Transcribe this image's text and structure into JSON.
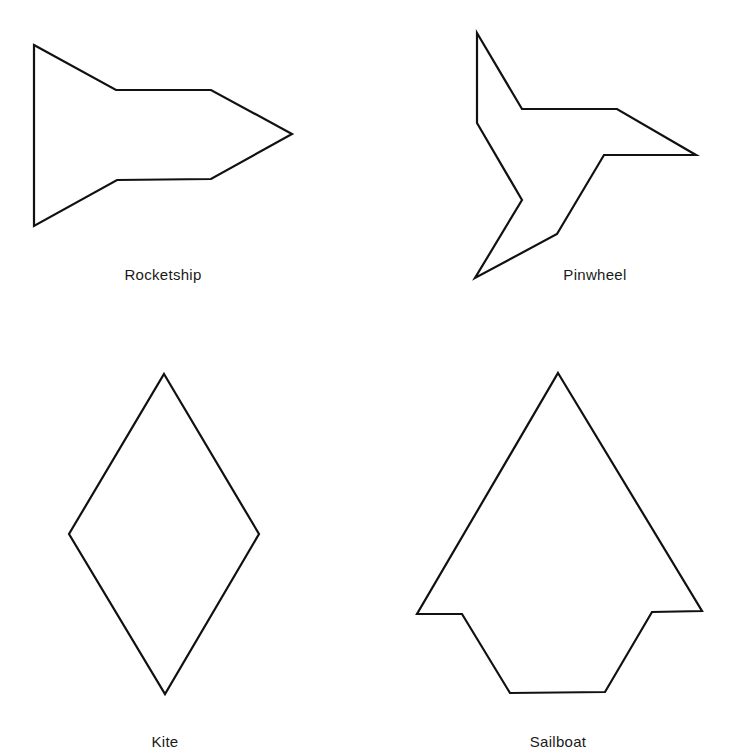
{
  "figure": {
    "stroke_color": "#111111",
    "background_color": "#ffffff",
    "shapes": [
      {
        "id": "rocketship",
        "label": "Rocketship",
        "label_pos": [
          163,
          276
        ],
        "points": [
          [
            34,
            45
          ],
          [
            116,
            90
          ],
          [
            211,
            90
          ],
          [
            292,
            134
          ],
          [
            211,
            179
          ],
          [
            117,
            180
          ],
          [
            34,
            226
          ]
        ]
      },
      {
        "id": "pinwheel",
        "label": "Pinwheel",
        "label_pos": [
          595,
          276
        ],
        "points": [
          [
            477,
            33
          ],
          [
            522,
            109
          ],
          [
            617,
            109
          ],
          [
            696,
            155
          ],
          [
            604,
            155
          ],
          [
            557,
            234
          ],
          [
            475,
            278
          ],
          [
            522,
            200
          ],
          [
            477,
            123
          ]
        ]
      },
      {
        "id": "kite",
        "label": "Kite",
        "label_pos": [
          165,
          743
        ],
        "points": [
          [
            164,
            374
          ],
          [
            259,
            534
          ],
          [
            165,
            694
          ],
          [
            69,
            534
          ]
        ]
      },
      {
        "id": "sailboat",
        "label": "Sailboat",
        "label_pos": [
          558,
          743
        ],
        "points": [
          [
            558,
            373
          ],
          [
            702,
            611
          ],
          [
            652,
            612
          ],
          [
            605,
            692
          ],
          [
            510,
            693
          ],
          [
            462,
            614
          ],
          [
            417,
            614
          ]
        ]
      }
    ]
  }
}
